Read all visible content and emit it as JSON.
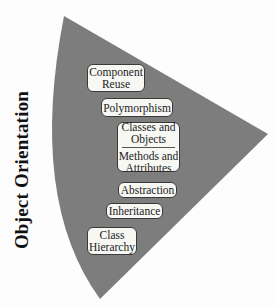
{
  "diagram": {
    "title": "Object Orientation",
    "colors": {
      "wedge": "#7d7d7d",
      "background": "#fdfdfd",
      "box_fill": "#f7f7f4",
      "box_border": "#3a3a3a",
      "text": "#111111"
    },
    "boxes": [
      {
        "id": "component-reuse",
        "lines": [
          "Component",
          "Reuse"
        ]
      },
      {
        "id": "polymorphism",
        "lines": [
          "Polymorphism"
        ]
      },
      {
        "id": "classes-methods",
        "upper": [
          "Classes and",
          "Objects"
        ],
        "lower": [
          "Methods and",
          "Attributes"
        ]
      },
      {
        "id": "abstraction",
        "lines": [
          "Abstraction"
        ]
      },
      {
        "id": "inheritance",
        "lines": [
          "Inheritance"
        ]
      },
      {
        "id": "class-hierarchy",
        "lines": [
          "Class",
          "Hierarchy"
        ]
      }
    ]
  }
}
